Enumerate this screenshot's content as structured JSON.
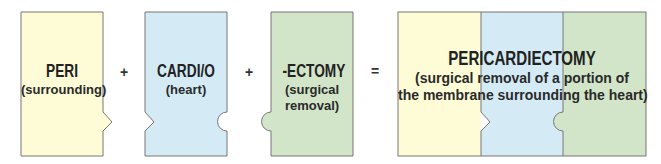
{
  "colors": {
    "yellow": "#fdfcd6",
    "blue": "#d4ebf6",
    "green": "#d2e5c9",
    "border": "#777777"
  },
  "parts": [
    {
      "term": "PERI",
      "meaning": "(surrounding)"
    },
    {
      "term": "CARDI/O",
      "meaning": "(heart)"
    },
    {
      "term": "-ECTOMY",
      "meaning_line1": "(surgical",
      "meaning_line2": "removal)"
    }
  ],
  "operators": {
    "plus1": "+",
    "plus2": "+",
    "equals": "="
  },
  "result": {
    "term": "PERICARDIECTOMY",
    "meaning_line1": "(surgical removal of a portion of",
    "meaning_line2": "the membrane surrounding the heart)"
  }
}
